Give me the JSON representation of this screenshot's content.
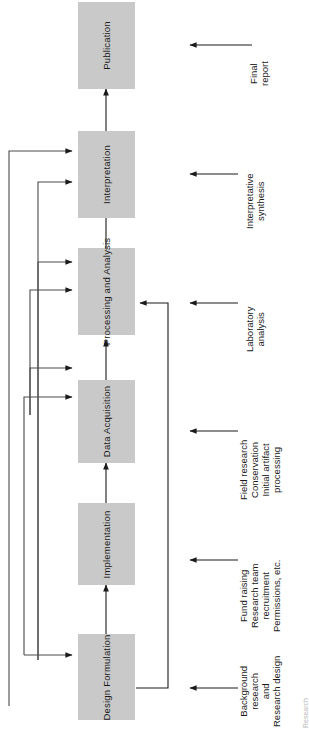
{
  "diagram": {
    "orientation": "rotated-90",
    "box_fill": "#c9c9c9",
    "line_color": "#1a1a1a",
    "nodes": [
      {
        "id": "publication",
        "label": "Publication"
      },
      {
        "id": "interpretation",
        "label": "Interpretation"
      },
      {
        "id": "processing",
        "label": "Processing\nand\nAnalysis",
        "line1": "Processing",
        "line2": "and",
        "line3": "Analysis"
      },
      {
        "id": "data",
        "label": "Data Acquisition",
        "line1": "Data",
        "line2": "Acquisition"
      },
      {
        "id": "implementation",
        "label": "Implementation"
      },
      {
        "id": "design",
        "label": "Design Formulation",
        "line1": "Design",
        "line2": "Formulation"
      }
    ],
    "side_labels": [
      {
        "id": "final-report",
        "lines": [
          "Final",
          "report"
        ]
      },
      {
        "id": "interpretive",
        "lines": [
          "Interpretative",
          "synthesis"
        ]
      },
      {
        "id": "laboratory",
        "lines": [
          "Laboratory",
          "analysis"
        ]
      },
      {
        "id": "field",
        "lines": [
          "Field research",
          "Conservation",
          "Initial artifact",
          "processing"
        ]
      },
      {
        "id": "funding",
        "lines": [
          "Fund raising",
          "Research team",
          "recruitment",
          "Permissions, etc."
        ]
      },
      {
        "id": "background",
        "lines": [
          "Background",
          "research",
          "and",
          "Research design"
        ]
      }
    ],
    "corner_note": "Research"
  }
}
